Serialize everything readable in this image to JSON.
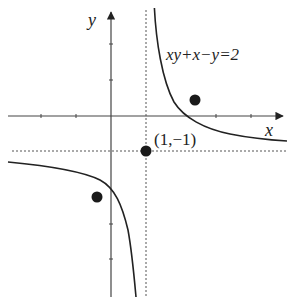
{
  "diagram": {
    "equation_label": "xy+x−y=2",
    "axis_x_label": "x",
    "axis_y_label": "y",
    "point_label": "(1,−1)",
    "asymptotes": {
      "vertical": "x=1",
      "horizontal": "y=−1"
    },
    "curve": "y = −1 + 1/(x−1)",
    "marked_point": {
      "x": 1,
      "y": -1
    },
    "extra_points": [
      {
        "x": 2.4,
        "y": 0.45
      },
      {
        "x": -0.4,
        "y": -2.3
      }
    ],
    "tick_spacing_units": 1,
    "colors": {
      "ink": "#222222",
      "background": "#ffffff"
    }
  }
}
